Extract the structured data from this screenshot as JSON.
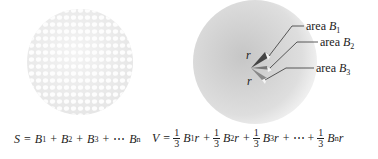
{
  "left_figure": {
    "description": "dimpled sphere divided into small surface areas",
    "equation": {
      "lhs": "S",
      "eq": "=",
      "terms": [
        "B",
        "B",
        "B",
        "B"
      ],
      "subs": [
        "1",
        "2",
        "3",
        "n"
      ],
      "ops": [
        "+",
        "+",
        "+",
        "⋯"
      ]
    }
  },
  "right_figure": {
    "description": "sphere with pyramids of height r from center to surface areas",
    "radius_labels": [
      "r",
      "r"
    ],
    "area_labels": [
      {
        "word": "area",
        "var": "B",
        "sub": "1"
      },
      {
        "word": "area",
        "var": "B",
        "sub": "2"
      },
      {
        "word": "area",
        "var": "B",
        "sub": "3"
      }
    ],
    "equation": {
      "lhs": "V",
      "eq": "=",
      "frac_num": "1",
      "frac_den": "3",
      "terms": [
        {
          "var": "B",
          "sub": "1",
          "r": "r"
        },
        {
          "var": "B",
          "sub": "2",
          "r": "r"
        },
        {
          "var": "B",
          "sub": "3",
          "r": "r"
        },
        {
          "var": "B",
          "sub": "n",
          "r": "r"
        }
      ],
      "ops": [
        "+",
        "+",
        "+ ⋯ +"
      ]
    }
  },
  "colors": {
    "sphere_left": "#f0f0f0",
    "dimple": "#ffffff",
    "sphere_right_center": "#c9c9c9",
    "sphere_right_edge": "#eeeeee",
    "line": "#333333"
  }
}
